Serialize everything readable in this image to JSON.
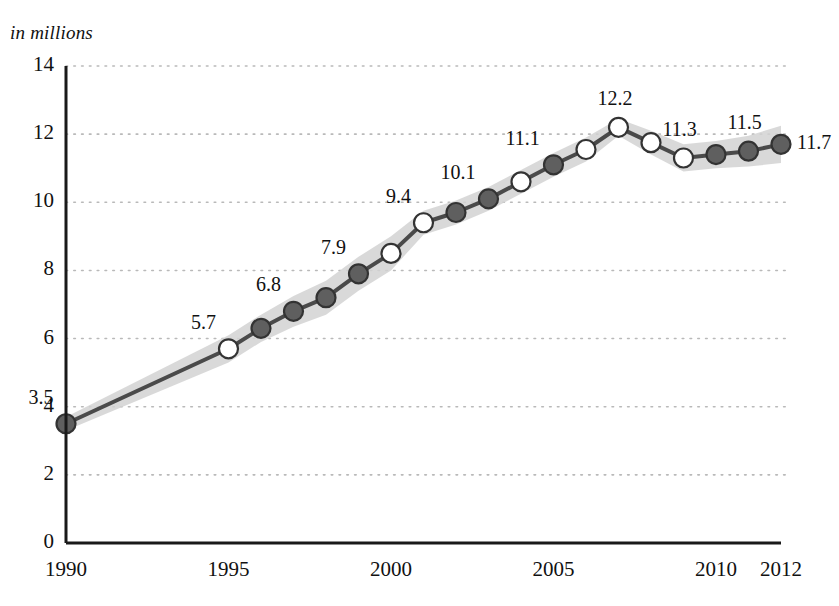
{
  "chart_data": {
    "type": "line",
    "title": "in millions",
    "subtitle": "",
    "xlabel": "",
    "ylabel": "in millions",
    "xlim": [
      1990,
      2012
    ],
    "ylim": [
      0,
      14
    ],
    "yticks": [
      0,
      2,
      4,
      6,
      8,
      10,
      12,
      14
    ],
    "xticks": [
      1990,
      1995,
      2000,
      2005,
      2010,
      2012
    ],
    "grid": "horizontal-dotted",
    "legend": "none",
    "x": [
      1990,
      1995,
      1996,
      1997,
      1998,
      1999,
      2000,
      2001,
      2002,
      2003,
      2004,
      2005,
      2006,
      2007,
      2008,
      2009,
      2010,
      2011,
      2012
    ],
    "values": [
      3.5,
      5.7,
      6.3,
      6.8,
      7.2,
      7.9,
      8.5,
      9.4,
      9.7,
      10.1,
      10.6,
      11.1,
      11.55,
      12.2,
      11.75,
      11.3,
      11.4,
      11.5,
      11.7
    ],
    "marker_styles": [
      "filled",
      "hollow",
      "filled",
      "filled",
      "filled",
      "filled",
      "hollow",
      "hollow",
      "filled",
      "filled",
      "hollow",
      "filled",
      "hollow",
      "hollow",
      "hollow",
      "hollow",
      "filled",
      "filled",
      "filled"
    ],
    "band": {
      "description": "light gray uncertainty envelope around the line",
      "upper": [
        3.7,
        6.1,
        6.7,
        7.25,
        7.7,
        8.4,
        9.0,
        9.75,
        10.05,
        10.45,
        10.95,
        11.45,
        11.9,
        12.45,
        12.1,
        11.7,
        11.8,
        11.95,
        12.25
      ],
      "lower": [
        3.3,
        5.3,
        5.9,
        6.35,
        6.7,
        7.4,
        8.0,
        9.05,
        9.35,
        9.75,
        10.25,
        10.75,
        11.2,
        11.95,
        11.4,
        10.9,
        11.0,
        11.05,
        11.15
      ]
    },
    "point_labels": [
      {
        "x": 1990,
        "value": 3.5,
        "text": "3.5",
        "pos": "above-left"
      },
      {
        "x": 1995,
        "value": 5.7,
        "text": "5.7",
        "pos": "above-left"
      },
      {
        "x": 1997,
        "value": 6.8,
        "text": "6.8",
        "pos": "above-left"
      },
      {
        "x": 1999,
        "value": 7.9,
        "text": "7.9",
        "pos": "above-left"
      },
      {
        "x": 2001,
        "value": 9.4,
        "text": "9.4",
        "pos": "above-left"
      },
      {
        "x": 2003,
        "value": 10.1,
        "text": "10.1",
        "pos": "above-left"
      },
      {
        "x": 2005,
        "value": 11.1,
        "text": "11.1",
        "pos": "above-left"
      },
      {
        "x": 2007,
        "value": 12.2,
        "text": "12.2",
        "pos": "above"
      },
      {
        "x": 2009,
        "value": 11.3,
        "text": "11.3",
        "pos": "above"
      },
      {
        "x": 2011,
        "value": 11.5,
        "text": "11.5",
        "pos": "above"
      },
      {
        "x": 2012,
        "value": 11.7,
        "text": "11.7",
        "pos": "right"
      }
    ],
    "colors": {
      "line": "#4a4a4a",
      "band": "#d2d2d2",
      "marker_fill": "#5f5f5f",
      "marker_hollow": "#ffffff",
      "marker_edge": "#333333",
      "axis": "#1a1a1a",
      "grid": "#b9b9b9",
      "text": "#111111"
    }
  },
  "axis": {
    "y_tick_labels": [
      "14",
      "12",
      "10",
      "8",
      "6",
      "4",
      "2",
      "0"
    ],
    "x_tick_labels": [
      "1990",
      "1995",
      "2000",
      "2005",
      "2010",
      "2012"
    ]
  },
  "header": {
    "units_note": "in millions"
  }
}
